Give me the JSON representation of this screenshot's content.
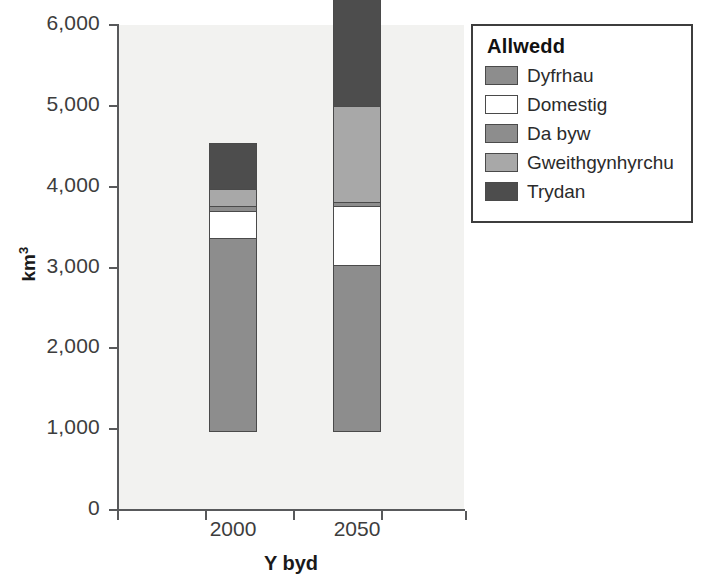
{
  "chart_data": {
    "type": "bar",
    "subtype": "stacked-bar",
    "title": "",
    "xlabel": "Y byd",
    "ylabel": "km³",
    "categories": [
      "2000",
      "2050"
    ],
    "ylim": [
      0,
      6000
    ],
    "ytick_values": [
      0,
      1000,
      2000,
      3000,
      4000,
      5000,
      6000
    ],
    "ytick_labels": [
      "0",
      "1,000",
      "2,000",
      "3,000",
      "4,000",
      "5,000",
      "6,000"
    ],
    "grid": false,
    "legend_position": "right",
    "legend_title": "Allwedd",
    "stack_order_bottom_to_top": [
      "Dyfrhau",
      "Domestig",
      "Da byw",
      "Gweithgynhyrchu",
      "Trydan"
    ],
    "series": [
      {
        "name": "Dyfrhau",
        "color": "#8d8d8d",
        "values": [
          2400,
          2060
        ]
      },
      {
        "name": "Domestig",
        "color": "#ffffff",
        "values": [
          330,
          730
        ]
      },
      {
        "name": "Da byw",
        "color": "#8d8d8d",
        "values": [
          60,
          60
        ]
      },
      {
        "name": "Gweithgynhyrchu",
        "color": "#a8a8a8",
        "values": [
          215,
          1180
        ]
      },
      {
        "name": "Trydan",
        "color": "#4d4d4d",
        "values": [
          565,
          1440
        ]
      }
    ],
    "totals": [
      3570,
      5470
    ]
  },
  "axes": {
    "y_title": "km",
    "y_title_superscript": "3",
    "x_title": "Y byd",
    "y_ticks": [
      {
        "label": "6,000",
        "value": 6000
      },
      {
        "label": "5,000",
        "value": 5000
      },
      {
        "label": "4,000",
        "value": 4000
      },
      {
        "label": "3,000",
        "value": 3000
      },
      {
        "label": "2,000",
        "value": 2000
      },
      {
        "label": "1,000",
        "value": 1000
      },
      {
        "label": "0",
        "value": 0
      }
    ],
    "x_categories": [
      {
        "label": "2000"
      },
      {
        "label": "2050"
      }
    ]
  },
  "legend": {
    "title": "Allwedd",
    "items": [
      {
        "label": "Dyfrhau",
        "color": "#8d8d8d"
      },
      {
        "label": "Domestig",
        "color": "#ffffff"
      },
      {
        "label": "Da byw",
        "color": "#8d8d8d"
      },
      {
        "label": "Gweithgynhyrchu",
        "color": "#a8a8a8"
      },
      {
        "label": "Trydan",
        "color": "#4d4d4d"
      }
    ]
  },
  "colors": {
    "plot_background": "#f2f2f0",
    "axis": "#58595b",
    "bar_outline": "#4a4a4a",
    "text": "#2b2b2b"
  }
}
